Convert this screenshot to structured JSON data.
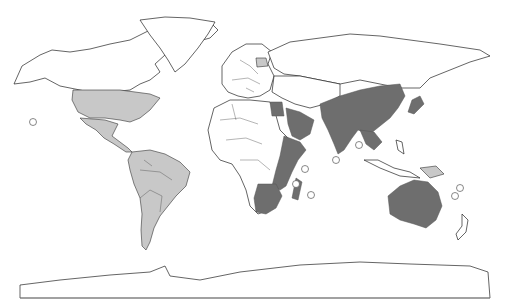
{
  "map": {
    "type": "world-choropleth",
    "projection": "equirectangular-like",
    "legend": null,
    "title": null,
    "colors": {
      "background": "#ffffff",
      "unshaded": "#ffffff",
      "light_category": "#c8c8c8",
      "dark_category": "#6e6e6e",
      "outline": "#222222"
    },
    "regions": {
      "light": [
        "United States",
        "Mexico",
        "Central America",
        "South America",
        "Poland",
        "Papua New Guinea"
      ],
      "dark": [
        "Egypt",
        "Saudi Arabia",
        "Yemen",
        "Oman",
        "Eritrea",
        "Ethiopia",
        "Somalia",
        "Kenya",
        "Tanzania",
        "Mozambique",
        "Madagascar",
        "South Africa",
        "Zimbabwe",
        "India",
        "Pakistan",
        "China",
        "Mongolia",
        "Korea",
        "Japan",
        "Thailand",
        "Vietnam",
        "Cambodia",
        "Australia"
      ],
      "unshaded": [
        "Canada",
        "Greenland",
        "Russia",
        "Europe",
        "Central Africa",
        "West Africa",
        "Indonesia",
        "Philippines",
        "New Zealand",
        "Antarctica"
      ]
    },
    "markers": [
      {
        "label": "circle",
        "x": 33,
        "y": 122
      },
      {
        "label": "circle",
        "x": 336,
        "y": 160
      },
      {
        "label": "circle",
        "x": 359,
        "y": 145
      },
      {
        "label": "circle",
        "x": 305,
        "y": 169
      },
      {
        "label": "circle",
        "x": 296,
        "y": 184
      },
      {
        "label": "circle",
        "x": 311,
        "y": 195
      },
      {
        "label": "circle",
        "x": 460,
        "y": 188
      },
      {
        "label": "circle",
        "x": 455,
        "y": 196
      }
    ]
  }
}
